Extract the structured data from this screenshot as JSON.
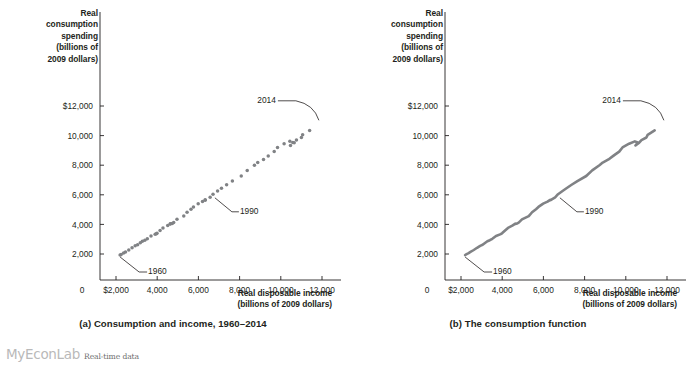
{
  "figure": {
    "footer_brand": "MyEconLab",
    "footer_note": "Real-time data"
  },
  "panels": [
    {
      "id": "a",
      "caption": "(a) Consumption and income, 1960–2014",
      "y_axis_title": "Real\nconsumption\nspending\n(billions of\n2009 dollars)",
      "x_axis_title": "Real disposable income\n(billions of 2009 dollars)",
      "y_title_lines": [
        "Real",
        "consumption",
        "spending",
        "(billions of",
        "2009 dollars)"
      ],
      "x_title_lines": [
        "Real disposable income",
        "(billions of 2009 dollars)"
      ],
      "callouts": [
        {
          "label": "1960"
        },
        {
          "label": "1990"
        },
        {
          "label": "2014"
        }
      ]
    },
    {
      "id": "b",
      "caption": "(b) The consumption function",
      "y_axis_title": "Real\nconsumption\nspending\n(billions of\n2009 dollars)",
      "x_axis_title": "Real disposable income\n(billions of 2009 dollars)",
      "y_title_lines": [
        "Real",
        "consumption",
        "spending",
        "(billions of",
        "2009 dollars)"
      ],
      "x_title_lines": [
        "Real disposable income",
        "(billions of 2009 dollars)"
      ],
      "callouts": [
        {
          "label": "1960"
        },
        {
          "label": "1990"
        },
        {
          "label": "2014"
        }
      ]
    }
  ],
  "chart_data": [
    {
      "type": "scatter",
      "panel": "a",
      "title": "(a) Consumption and income, 1960–2014",
      "xlabel": "Real disposable income (billions of 2009 dollars)",
      "ylabel": "Real consumption spending (billions of 2009 dollars)",
      "xlim": [
        0,
        13000
      ],
      "ylim": [
        0,
        13000
      ],
      "xticks": [
        0,
        2000,
        4000,
        6000,
        8000,
        10000,
        12000
      ],
      "xtick_labels": [
        "0",
        "$2,000",
        "4,000",
        "6,000",
        "8,000",
        "10,000",
        "12,000"
      ],
      "yticks": [
        2000,
        4000,
        6000,
        8000,
        10000,
        12000
      ],
      "ytick_labels": [
        "2,000",
        "4,000",
        "6,000",
        "8,000",
        "10,000",
        "$12,000"
      ],
      "grid": false,
      "legend": "none",
      "marker": "circle",
      "marker_color": "#808285",
      "annotations": [
        {
          "label": "1960",
          "x": 2200,
          "y": 1900
        },
        {
          "label": "1990",
          "x": 6800,
          "y": 5900
        },
        {
          "label": "2014",
          "x": 11900,
          "y": 10900
        }
      ],
      "series": [
        {
          "name": "Consumption vs. disposable income",
          "years": [
            1960,
            1961,
            1962,
            1963,
            1964,
            1965,
            1966,
            1967,
            1968,
            1969,
            1970,
            1971,
            1972,
            1973,
            1974,
            1975,
            1976,
            1977,
            1978,
            1979,
            1980,
            1981,
            1982,
            1983,
            1984,
            1985,
            1986,
            1987,
            1988,
            1989,
            1990,
            1991,
            1992,
            1993,
            1994,
            1995,
            1996,
            1997,
            1998,
            1999,
            2000,
            2001,
            2002,
            2003,
            2004,
            2005,
            2006,
            2007,
            2008,
            2009,
            2010,
            2011,
            2012,
            2013,
            2014
          ],
          "x": [
            2200,
            2250,
            2370,
            2460,
            2620,
            2780,
            2930,
            3050,
            3180,
            3280,
            3400,
            3520,
            3700,
            3960,
            3900,
            3990,
            4140,
            4280,
            4510,
            4640,
            4630,
            4730,
            4800,
            4960,
            5290,
            5450,
            5640,
            5760,
            5990,
            6200,
            6330,
            6330,
            6570,
            6710,
            6930,
            7120,
            7370,
            7650,
            8080,
            8370,
            8720,
            8880,
            9160,
            9390,
            9680,
            9840,
            10160,
            10440,
            10580,
            10470,
            10650,
            10760,
            11000,
            11060,
            11400
          ],
          "y": [
            1930,
            1970,
            2060,
            2140,
            2270,
            2420,
            2550,
            2620,
            2760,
            2860,
            2930,
            3030,
            3220,
            3360,
            3330,
            3400,
            3590,
            3760,
            3930,
            4050,
            4020,
            4060,
            4120,
            4340,
            4560,
            4820,
            5030,
            5180,
            5400,
            5540,
            5660,
            5630,
            5830,
            6040,
            6260,
            6440,
            6680,
            6930,
            7270,
            7650,
            8000,
            8180,
            8390,
            8630,
            8920,
            9200,
            9450,
            9610,
            9540,
            9330,
            9520,
            9700,
            9870,
            10050,
            10350
          ]
        }
      ]
    },
    {
      "type": "line",
      "panel": "b",
      "title": "(b) The consumption function",
      "xlabel": "Real disposable income (billions of 2009 dollars)",
      "ylabel": "Real consumption spending (billions of 2009 dollars)",
      "xlim": [
        0,
        13000
      ],
      "ylim": [
        0,
        13000
      ],
      "xticks": [
        0,
        2000,
        4000,
        6000,
        8000,
        10000,
        12000
      ],
      "xtick_labels": [
        "0",
        "$2,000",
        "4,000",
        "6,000",
        "8,000",
        "10,000",
        "12,000"
      ],
      "yticks": [
        2000,
        4000,
        6000,
        8000,
        10000,
        12000
      ],
      "ytick_labels": [
        "2,000",
        "4,000",
        "6,000",
        "8,000",
        "10,000",
        "$12,000"
      ],
      "grid": false,
      "legend": "none",
      "line_color": "#808285",
      "annotations": [
        {
          "label": "1960",
          "x": 2200,
          "y": 1900
        },
        {
          "label": "1990",
          "x": 6800,
          "y": 5900
        },
        {
          "label": "2014",
          "x": 11900,
          "y": 10900
        }
      ],
      "series": [
        {
          "name": "The consumption function",
          "years": [
            1960,
            1961,
            1962,
            1963,
            1964,
            1965,
            1966,
            1967,
            1968,
            1969,
            1970,
            1971,
            1972,
            1973,
            1974,
            1975,
            1976,
            1977,
            1978,
            1979,
            1980,
            1981,
            1982,
            1983,
            1984,
            1985,
            1986,
            1987,
            1988,
            1989,
            1990,
            1991,
            1992,
            1993,
            1994,
            1995,
            1996,
            1997,
            1998,
            1999,
            2000,
            2001,
            2002,
            2003,
            2004,
            2005,
            2006,
            2007,
            2008,
            2009,
            2010,
            2011,
            2012,
            2013,
            2014
          ],
          "x": [
            2200,
            2250,
            2370,
            2460,
            2620,
            2780,
            2930,
            3050,
            3180,
            3280,
            3400,
            3520,
            3700,
            3960,
            3900,
            3990,
            4140,
            4280,
            4510,
            4640,
            4630,
            4730,
            4800,
            4960,
            5290,
            5450,
            5640,
            5760,
            5990,
            6200,
            6330,
            6330,
            6570,
            6710,
            6930,
            7120,
            7370,
            7650,
            8080,
            8370,
            8720,
            8880,
            9160,
            9390,
            9680,
            9840,
            10160,
            10440,
            10580,
            10470,
            10650,
            10760,
            11000,
            11060,
            11400
          ],
          "y": [
            1930,
            1970,
            2060,
            2140,
            2270,
            2420,
            2550,
            2620,
            2760,
            2860,
            2930,
            3030,
            3220,
            3360,
            3330,
            3400,
            3590,
            3760,
            3930,
            4050,
            4020,
            4060,
            4120,
            4340,
            4560,
            4820,
            5030,
            5180,
            5400,
            5540,
            5660,
            5630,
            5830,
            6040,
            6260,
            6440,
            6680,
            6930,
            7270,
            7650,
            8000,
            8180,
            8390,
            8630,
            8920,
            9200,
            9450,
            9610,
            9540,
            9330,
            9520,
            9700,
            9870,
            10050,
            10350
          ]
        }
      ]
    }
  ]
}
